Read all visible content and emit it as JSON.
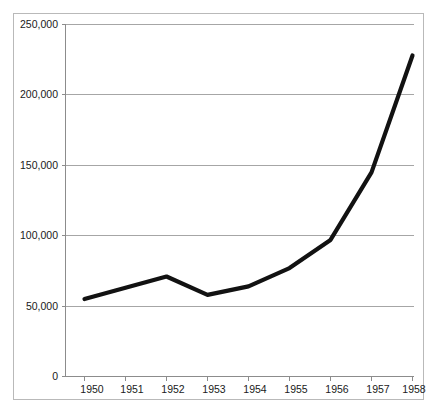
{
  "chart_data": {
    "type": "line",
    "title": "",
    "subtitle": "",
    "xlabel": "",
    "ylabel": "",
    "categories": [
      "1950",
      "1951",
      "1952",
      "1953",
      "1954",
      "1955",
      "1956",
      "1957",
      "1958"
    ],
    "x": [
      1950,
      1951,
      1952,
      1953,
      1954,
      1955,
      1956,
      1957,
      1958
    ],
    "values": [
      55000,
      63000,
      71000,
      58000,
      64000,
      77000,
      97000,
      145000,
      228000
    ],
    "series": [
      {
        "name": "",
        "values": [
          55000,
          63000,
          71000,
          58000,
          64000,
          77000,
          97000,
          145000,
          228000
        ]
      }
    ],
    "ylim": [
      0,
      250000
    ],
    "ytick_values": [
      0,
      50000,
      100000,
      150000,
      200000,
      250000
    ],
    "ytick_labels": [
      "0",
      "50,000",
      "100,000",
      "150,000",
      "200,000",
      "250,000"
    ],
    "xtick_labels": [
      "1950",
      "1951",
      "1952",
      "1953",
      "1954",
      "1955",
      "1956",
      "1957",
      "1958"
    ],
    "grid": true,
    "grid_axis": "y",
    "legend": false,
    "legend_position": "none",
    "line_color": "#121212",
    "grid_color": "#a6a6a6",
    "axis_color": "#8c8c8c",
    "background_color": "#ffffff",
    "markers": false,
    "annotations": []
  },
  "axes": {
    "y": {
      "ticks": [
        {
          "label": "250,000",
          "value": 250000
        },
        {
          "label": "200,000",
          "value": 200000
        },
        {
          "label": "150,000",
          "value": 150000
        },
        {
          "label": "100,000",
          "value": 100000
        },
        {
          "label": "50,000",
          "value": 50000
        },
        {
          "label": "0",
          "value": 0
        }
      ]
    },
    "x": {
      "ticks": [
        {
          "label": "1950",
          "value": 1950
        },
        {
          "label": "1951",
          "value": 1951
        },
        {
          "label": "1952",
          "value": 1952
        },
        {
          "label": "1953",
          "value": 1953
        },
        {
          "label": "1954",
          "value": 1954
        },
        {
          "label": "1955",
          "value": 1955
        },
        {
          "label": "1956",
          "value": 1956
        },
        {
          "label": "1957",
          "value": 1957
        },
        {
          "label": "1958",
          "value": 1958
        }
      ]
    }
  }
}
